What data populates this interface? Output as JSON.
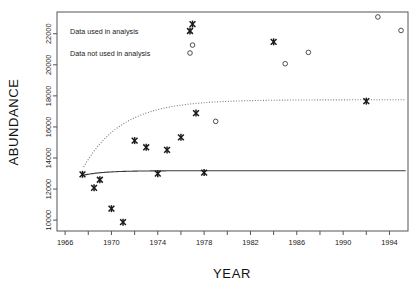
{
  "chart_data": {
    "type": "scatter",
    "title": "",
    "xlabel": "YEAR",
    "ylabel": "ABUNDANCE",
    "xlim": [
      1965.3,
      1995.6
    ],
    "ylim": [
      9300,
      23400
    ],
    "grid": false,
    "xticks": [
      1966,
      1968,
      1970,
      1972,
      1974,
      1976,
      1978,
      1980,
      1982,
      1984,
      1986,
      1988,
      1990,
      1992,
      1994
    ],
    "xtick_labels": [
      "1966",
      "",
      "1970",
      "",
      "1974",
      "",
      "1978",
      "",
      "1982",
      "",
      "1986",
      "",
      "1990",
      "",
      "1994"
    ],
    "yticks": [
      10000,
      12000,
      14000,
      16000,
      18000,
      20000,
      22000
    ],
    "ytick_labels": [
      "10000",
      "12000",
      "14000",
      "16000",
      "18000",
      "20000",
      "22000"
    ],
    "legend_position": "top-left",
    "series": [
      {
        "name": "Data used in analysis",
        "marker": "x",
        "points": [
          {
            "x": 1967.5,
            "y": 12950
          },
          {
            "x": 1968.5,
            "y": 12080
          },
          {
            "x": 1969.0,
            "y": 12600
          },
          {
            "x": 1970.0,
            "y": 10740
          },
          {
            "x": 1971.0,
            "y": 9870
          },
          {
            "x": 1972.0,
            "y": 15120
          },
          {
            "x": 1973.0,
            "y": 14690
          },
          {
            "x": 1974.0,
            "y": 12990
          },
          {
            "x": 1974.8,
            "y": 14520
          },
          {
            "x": 1976.0,
            "y": 15330
          },
          {
            "x": 1977.0,
            "y": 22620
          },
          {
            "x": 1977.3,
            "y": 16890
          },
          {
            "x": 1978.0,
            "y": 13060
          },
          {
            "x": 1984.0,
            "y": 21480
          },
          {
            "x": 1992.0,
            "y": 17660
          }
        ]
      },
      {
        "name": "Data not used in analysis",
        "marker": "o",
        "points": [
          {
            "x": 1977.0,
            "y": 21270
          },
          {
            "x": 1979.0,
            "y": 16360
          },
          {
            "x": 1985.0,
            "y": 20070
          },
          {
            "x": 1987.0,
            "y": 20800
          },
          {
            "x": 1993.0,
            "y": 23080
          },
          {
            "x": 1995.0,
            "y": 22210
          }
        ]
      }
    ],
    "fitted_curves": [
      {
        "name": "lower-asymptote-fit",
        "style": "solid",
        "asymptote": 13180,
        "start_x": 1967.6,
        "end_x": 1995.4,
        "start_y": 12900
      },
      {
        "name": "upper-asymptote-fit",
        "style": "dotted",
        "asymptote": 17750,
        "start_x": 1967.6,
        "end_x": 1995.4,
        "start_y": 13420
      }
    ]
  },
  "legend": {
    "entries": [
      {
        "label": "Data used in analysis",
        "marker": "x"
      },
      {
        "label": "Data not used in analysis",
        "marker": "o"
      }
    ]
  }
}
